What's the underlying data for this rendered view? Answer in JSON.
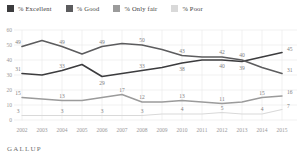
{
  "legend": {
    "items": [
      {
        "label": "% Excellent",
        "color": "#3c3c3e"
      },
      {
        "label": "% Good",
        "color": "#5c5c5e"
      },
      {
        "label": "% Only fair",
        "color": "#9b9b9b"
      },
      {
        "label": "% Poor",
        "color": "#d9d9d9"
      }
    ]
  },
  "footer": {
    "brand": "GALLUP"
  },
  "chart_data": {
    "type": "line",
    "title": "",
    "xlabel": "",
    "ylabel": "",
    "x": [
      2002,
      2003,
      2004,
      2005,
      2006,
      2007,
      2008,
      2009,
      2010,
      2011,
      2012,
      2013,
      2014,
      2015
    ],
    "ylim": [
      0,
      60
    ],
    "yticks": [
      60,
      50,
      40,
      30,
      20,
      10,
      0
    ],
    "grid": true,
    "legend_position": "top",
    "axis_text_color": "#999999",
    "grid_color": "#ebebeb",
    "label_text_color": "#7e7e7e",
    "series": [
      {
        "name": "% Good",
        "color": "#5c5c5e",
        "width": 1.6,
        "values": [
          49,
          53,
          49,
          44,
          49,
          51,
          50,
          47,
          43,
          42,
          42,
          40,
          35,
          31
        ],
        "labels": [
          {
            "year": 2002,
            "value": 49,
            "pos": "above"
          },
          {
            "year": 2004,
            "value": 49,
            "pos": "above"
          },
          {
            "year": 2006,
            "value": 49,
            "pos": "above"
          },
          {
            "year": 2008,
            "value": 50,
            "pos": "above"
          },
          {
            "year": 2010,
            "value": 43,
            "pos": "above"
          },
          {
            "year": 2012,
            "value": 42,
            "pos": "above"
          },
          {
            "year": 2013,
            "value": 40,
            "pos": "above"
          },
          {
            "year": 2015,
            "value": 31,
            "pos": "end"
          }
        ]
      },
      {
        "name": "% Excellent",
        "color": "#3c3c3e",
        "width": 1.6,
        "values": [
          31,
          30,
          33,
          37,
          29,
          31,
          33,
          35,
          38,
          40,
          40,
          39,
          42,
          45
        ],
        "labels": [
          {
            "year": 2002,
            "value": 31,
            "pos": "above"
          },
          {
            "year": 2004,
            "value": 33,
            "pos": "above"
          },
          {
            "year": 2006,
            "value": 29,
            "pos": "below"
          },
          {
            "year": 2008,
            "value": 33,
            "pos": "above"
          },
          {
            "year": 2010,
            "value": 38,
            "pos": "below"
          },
          {
            "year": 2012,
            "value": 40,
            "pos": "below"
          },
          {
            "year": 2013,
            "value": 39,
            "pos": "below"
          },
          {
            "year": 2015,
            "value": 45,
            "pos": "end"
          }
        ]
      },
      {
        "name": "% Only fair",
        "color": "#9b9b9b",
        "width": 1.4,
        "values": [
          15,
          14,
          13,
          13,
          15,
          17,
          12,
          12,
          13,
          12,
          11,
          12,
          15,
          16
        ],
        "labels": [
          {
            "year": 2002,
            "value": 15,
            "pos": "above"
          },
          {
            "year": 2004,
            "value": 13,
            "pos": "above"
          },
          {
            "year": 2007,
            "value": 17,
            "pos": "above"
          },
          {
            "year": 2008,
            "value": 12,
            "pos": "above"
          },
          {
            "year": 2010,
            "value": 13,
            "pos": "above"
          },
          {
            "year": 2012,
            "value": 11,
            "pos": "above"
          },
          {
            "year": 2014,
            "value": 15,
            "pos": "above"
          },
          {
            "year": 2015,
            "value": 16,
            "pos": "end"
          }
        ]
      },
      {
        "name": "% Poor",
        "color": "#d9d9d9",
        "width": 1.2,
        "values": [
          3,
          3,
          3,
          3,
          3,
          3,
          3,
          4,
          4,
          4,
          5,
          4,
          4,
          7
        ],
        "labels": [
          {
            "year": 2002,
            "value": 3,
            "pos": "above"
          },
          {
            "year": 2004,
            "value": 3,
            "pos": "above"
          },
          {
            "year": 2006,
            "value": 3,
            "pos": "above"
          },
          {
            "year": 2008,
            "value": 3,
            "pos": "above"
          },
          {
            "year": 2010,
            "value": 4,
            "pos": "above"
          },
          {
            "year": 2012,
            "value": 5,
            "pos": "above"
          },
          {
            "year": 2014,
            "value": 4,
            "pos": "above"
          },
          {
            "year": 2015,
            "value": 7,
            "pos": "end"
          }
        ]
      }
    ]
  }
}
